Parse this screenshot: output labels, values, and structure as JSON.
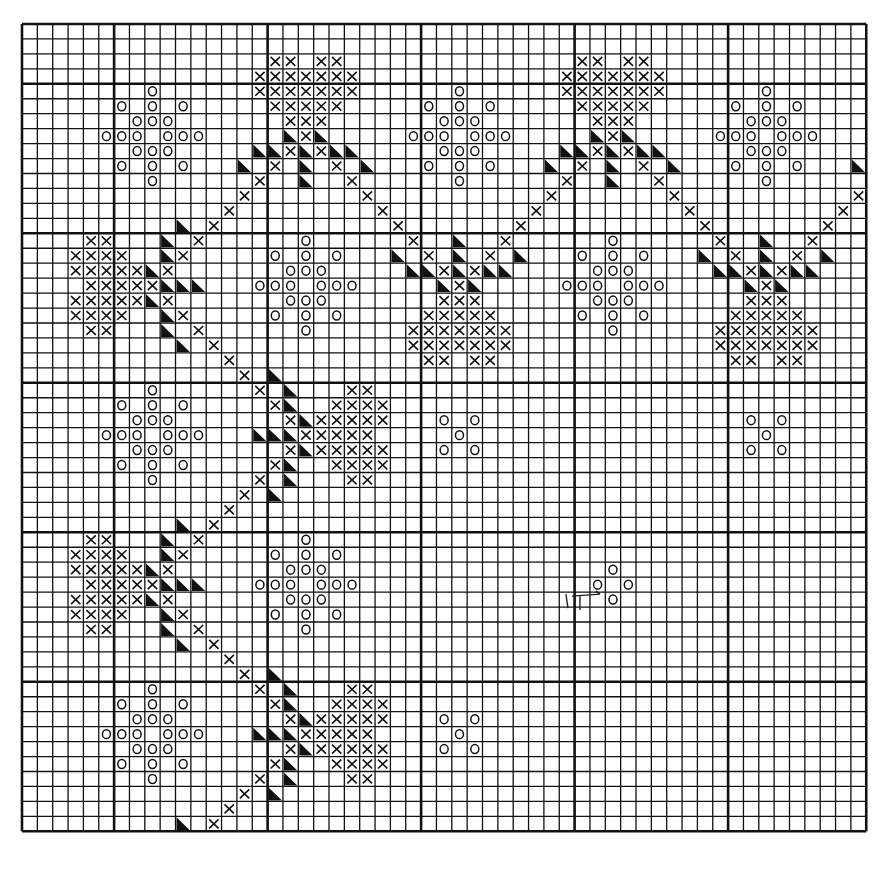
{
  "chart_data": {
    "type": "cross-stitch-pattern",
    "title": "",
    "grid": {
      "cols": 55,
      "rows": 54,
      "origin_x": 22,
      "origin_y": 24,
      "cell_w": 15.35,
      "cell_h": 14.95,
      "heavy_line_cols": [
        6,
        16,
        26,
        36,
        46
      ],
      "heavy_line_rows": [
        4,
        14,
        24,
        34,
        44
      ],
      "line_color": "#111111",
      "symbol_color": "#111111",
      "background": "#ffffff"
    },
    "legend_symbols": {
      "x": "cross stitch",
      "o": "circle stitch",
      "t": "half-filled triangle stitch"
    },
    "templates": {
      "flower": [
        [
          "o",
          0,
          -3
        ],
        [
          "o",
          -2,
          -2
        ],
        [
          "o",
          0,
          -2
        ],
        [
          "o",
          2,
          -2
        ],
        [
          "o",
          -1,
          -1
        ],
        [
          "o",
          0,
          -1
        ],
        [
          "o",
          1,
          -1
        ],
        [
          "o",
          -3,
          0
        ],
        [
          "o",
          -2,
          0
        ],
        [
          "o",
          -1,
          0
        ],
        [
          "o",
          1,
          0
        ],
        [
          "o",
          2,
          0
        ],
        [
          "o",
          3,
          0
        ],
        [
          "o",
          -1,
          1
        ],
        [
          "o",
          0,
          1
        ],
        [
          "o",
          1,
          1
        ],
        [
          "o",
          -2,
          2
        ],
        [
          "o",
          0,
          2
        ],
        [
          "o",
          2,
          2
        ],
        [
          "o",
          0,
          3
        ]
      ],
      "quincunx": [
        [
          "o",
          -1,
          -1
        ],
        [
          "o",
          1,
          -1
        ],
        [
          "o",
          0,
          0
        ],
        [
          "o",
          -1,
          1
        ],
        [
          "o",
          1,
          1
        ]
      ],
      "diamond": [
        [
          "o",
          0,
          -1
        ],
        [
          "o",
          -1,
          0
        ],
        [
          "o",
          1,
          0
        ],
        [
          "o",
          0,
          1
        ]
      ],
      "sprig_up": [
        [
          "x",
          -2,
          -5
        ],
        [
          "x",
          -1,
          -5
        ],
        [
          "x",
          1,
          -5
        ],
        [
          "x",
          2,
          -5
        ],
        [
          "x",
          -3,
          -4
        ],
        [
          "x",
          -2,
          -4
        ],
        [
          "x",
          -1,
          -4
        ],
        [
          "x",
          0,
          -4
        ],
        [
          "x",
          1,
          -4
        ],
        [
          "x",
          2,
          -4
        ],
        [
          "x",
          3,
          -4
        ],
        [
          "x",
          -3,
          -3
        ],
        [
          "x",
          -2,
          -3
        ],
        [
          "x",
          -1,
          -3
        ],
        [
          "x",
          0,
          -3
        ],
        [
          "x",
          1,
          -3
        ],
        [
          "x",
          2,
          -3
        ],
        [
          "x",
          3,
          -3
        ],
        [
          "x",
          -2,
          -2
        ],
        [
          "x",
          -1,
          -2
        ],
        [
          "x",
          0,
          -2
        ],
        [
          "x",
          1,
          -2
        ],
        [
          "x",
          2,
          -2
        ],
        [
          "x",
          -1,
          -1
        ],
        [
          "x",
          0,
          -1
        ],
        [
          "x",
          1,
          -1
        ],
        [
          "t",
          -1,
          0
        ],
        [
          "x",
          0,
          0
        ],
        [
          "t",
          1,
          0
        ],
        [
          "t",
          -3,
          1
        ],
        [
          "t",
          -2,
          1
        ],
        [
          "x",
          -1,
          1
        ],
        [
          "t",
          0,
          1
        ],
        [
          "x",
          1,
          1
        ],
        [
          "t",
          2,
          1
        ],
        [
          "t",
          3,
          1
        ],
        [
          "t",
          -4,
          2
        ],
        [
          "x",
          -2,
          2
        ],
        [
          "t",
          0,
          2
        ],
        [
          "x",
          2,
          2
        ],
        [
          "t",
          4,
          2
        ],
        [
          "x",
          -3,
          3
        ],
        [
          "t",
          0,
          3
        ],
        [
          "x",
          3,
          3
        ],
        [
          "x",
          -4,
          4
        ],
        [
          "x",
          4,
          4
        ],
        [
          "x",
          -5,
          5
        ],
        [
          "x",
          5,
          5
        ],
        [
          "x",
          -6,
          6
        ],
        [
          "x",
          6,
          6
        ],
        [
          "x",
          -7,
          7
        ],
        [
          "x",
          7,
          7
        ],
        [
          "x",
          -8,
          8
        ],
        [
          "x",
          8,
          8
        ],
        [
          "x",
          -9,
          9
        ],
        [
          "x",
          9,
          9
        ]
      ]
    },
    "placements": [
      {
        "motif": "flower",
        "col": 8,
        "row": 7
      },
      {
        "motif": "flower",
        "col": 28,
        "row": 7
      },
      {
        "motif": "flower",
        "col": 48,
        "row": 7
      },
      {
        "motif": "flower",
        "col": 18,
        "row": 17
      },
      {
        "motif": "flower",
        "col": 38,
        "row": 17
      },
      {
        "motif": "flower",
        "col": 8,
        "row": 27
      },
      {
        "motif": "flower",
        "col": 18,
        "row": 37
      },
      {
        "motif": "flower",
        "col": 8,
        "row": 47
      },
      {
        "motif": "quincunx",
        "col": 28,
        "row": 27
      },
      {
        "motif": "quincunx",
        "col": 48,
        "row": 27
      },
      {
        "motif": "quincunx",
        "col": 28,
        "row": 47
      },
      {
        "motif": "diamond",
        "col": 38,
        "row": 37
      },
      {
        "motif": "sprig_up",
        "orientation": "up",
        "col": 18,
        "row": 7
      },
      {
        "motif": "sprig_up",
        "orientation": "up",
        "col": 38,
        "row": 7
      },
      {
        "motif": "sprig_up",
        "orientation": "up",
        "col": 58,
        "row": 7
      },
      {
        "motif": "sprig_up",
        "orientation": "down",
        "col": 28,
        "row": 17
      },
      {
        "motif": "sprig_up",
        "orientation": "down",
        "col": 48,
        "row": 17
      },
      {
        "motif": "sprig_up",
        "orientation": "left",
        "col": 8,
        "row": 17
      },
      {
        "motif": "sprig_up",
        "orientation": "left",
        "col": 8,
        "row": 37
      },
      {
        "motif": "sprig_up",
        "orientation": "left",
        "col": 8,
        "row": 57
      },
      {
        "motif": "sprig_up",
        "orientation": "right",
        "col": 18,
        "row": 27
      },
      {
        "motif": "sprig_up",
        "orientation": "right",
        "col": 18,
        "row": 47
      }
    ],
    "annotations": [
      {
        "type": "hand-drawn-arrow",
        "col": 37,
        "row": 38,
        "text": ""
      }
    ]
  }
}
